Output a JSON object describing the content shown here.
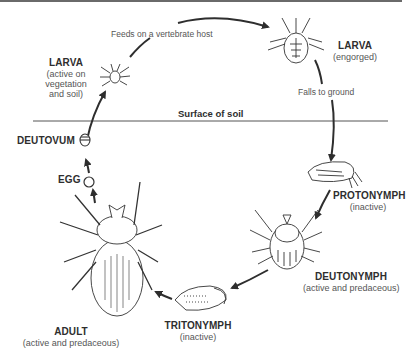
{
  "diagram": {
    "surface_label": "Surface of soil",
    "transitions": {
      "feeds": "Feeds on a vertebrate host",
      "falls": "Falls to ground"
    },
    "stages": {
      "larva_active": {
        "name": "LARVA",
        "desc_lines": [
          "(active on",
          "vegetation",
          "and soil)"
        ]
      },
      "larva_engorged": {
        "name": "LARVA",
        "desc": "(engorged)"
      },
      "protonymph": {
        "name": "PROTONYMPH",
        "desc": "(inactive)"
      },
      "deutonymph": {
        "name": "DEUTONYMPH",
        "desc": "(active and predaceous)"
      },
      "tritonymph": {
        "name": "TRITONYMPH",
        "desc": "(inactive)"
      },
      "adult": {
        "name": "ADULT",
        "desc": "(active and predaceous)"
      },
      "egg": {
        "name": "EGG"
      },
      "deutovum": {
        "name": "DEUTOVUM"
      }
    },
    "colors": {
      "ink": "#2e2e2e",
      "text_muted": "#555555",
      "line": "#6a6a6a"
    }
  }
}
